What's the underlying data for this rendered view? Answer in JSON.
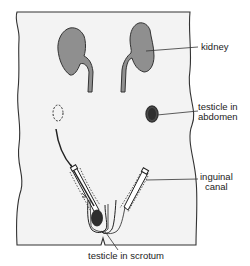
{
  "diagram": {
    "type": "anatomical",
    "colors": {
      "body_fill": "#f3f3f3",
      "outline": "#333333",
      "organ_fill": "#8f8f8f",
      "testicle_fill": "#2e2e2e",
      "background": "#ffffff"
    },
    "labels": {
      "kidney": "kidney",
      "testicle_abdomen_line1": "testicle in",
      "testicle_abdomen_line2": "abdomen",
      "inguinal_line1": "inguinal",
      "inguinal_line2": "canal",
      "testicle_scrotum": "testicle in scrotum"
    }
  }
}
